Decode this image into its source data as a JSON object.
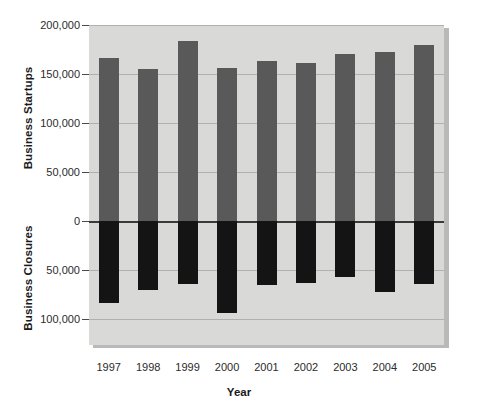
{
  "chart_data": {
    "type": "bar",
    "title": "",
    "subtitle": "",
    "xlabel": "Year",
    "ylabel_top": "Business Startups",
    "ylabel_bottom": "Business Closures",
    "categories": [
      "1997",
      "1998",
      "1999",
      "2000",
      "2001",
      "2002",
      "2003",
      "2004",
      "2005"
    ],
    "series": [
      {
        "name": "Business Startups",
        "direction": "up",
        "color": "#595959",
        "values": [
          166000,
          155000,
          184000,
          156000,
          163000,
          161000,
          170000,
          172000,
          180000
        ]
      },
      {
        "name": "Business Closures",
        "direction": "down",
        "color": "#141414",
        "values": [
          84000,
          70000,
          64000,
          94000,
          65000,
          63000,
          57000,
          72000,
          64000
        ]
      }
    ],
    "ylim": [
      -100000,
      200000
    ],
    "yticks": [
      200000,
      150000,
      100000,
      50000,
      0,
      -50000,
      -100000
    ],
    "ytick_labels": [
      "200,000",
      "150,000",
      "100,000",
      "50,000",
      "0",
      "50,000",
      "100,000"
    ],
    "grid": true,
    "legend": "none",
    "plot_background": "#d9d9d7"
  },
  "axis": {
    "x_title": "Year",
    "y_title_upper": "Business Startups",
    "y_title_lower": "Business Closures"
  }
}
